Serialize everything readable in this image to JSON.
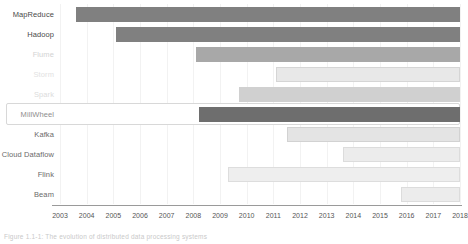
{
  "chart_data": {
    "type": "bar",
    "orientation": "horizontal",
    "subtype": "gantt-timeline",
    "title": "",
    "xlabel": "",
    "ylabel": "",
    "xlim": [
      2003,
      2018
    ],
    "grid": true,
    "legend": null,
    "categories": [
      "MapReduce",
      "Hadoop",
      "Flume",
      "Storm",
      "Spark",
      "MillWheel",
      "Kafka",
      "Cloud Dataflow",
      "Flink",
      "Beam"
    ],
    "xticks": [
      "2003",
      "2004",
      "2005",
      "2006",
      "2007",
      "2008",
      "2009",
      "2010",
      "2011",
      "2012",
      "2013",
      "2014",
      "2015",
      "2016",
      "2017",
      "2018"
    ],
    "bars": [
      {
        "label": "MapReduce",
        "start": 2003.6,
        "end": 2018.0,
        "color": "#808080",
        "label_color": "#4a4a4a",
        "border": "none"
      },
      {
        "label": "Hadoop",
        "start": 2005.1,
        "end": 2018.0,
        "color": "#808080",
        "label_color": "#4a4a4a",
        "border": "none"
      },
      {
        "label": "Flume",
        "start": 2008.1,
        "end": 2018.0,
        "color": "#a8a8a8",
        "label_color": "#d3d3d3",
        "border": "none"
      },
      {
        "label": "Storm",
        "start": 2011.1,
        "end": 2018.0,
        "color": "#e8e8e8",
        "label_color": "#e2e2e2",
        "border": "#d5d5d5"
      },
      {
        "label": "Spark",
        "start": 2009.7,
        "end": 2018.0,
        "color": "#d0d0d0",
        "label_color": "#dcdcdc",
        "border": "none"
      },
      {
        "label": "MillWheel",
        "start": 2008.2,
        "end": 2018.0,
        "color": "#6e6e6e",
        "label_color": "#8e8e8e",
        "border": "none"
      },
      {
        "label": "Kafka",
        "start": 2011.5,
        "end": 2018.0,
        "color": "#e4e4e4",
        "label_color": "#6a6a6a",
        "border": "#d2d2d2"
      },
      {
        "label": "Cloud Dataflow",
        "start": 2013.6,
        "end": 2018.0,
        "color": "#ececec",
        "label_color": "#6a6a6a",
        "border": "#dcdcdc"
      },
      {
        "label": "Flink",
        "start": 2009.3,
        "end": 2018.0,
        "color": "#eeeeee",
        "label_color": "#6a6a6a",
        "border": "#dddddd"
      },
      {
        "label": "Beam",
        "start": 2015.8,
        "end": 2018.0,
        "color": "#ececec",
        "label_color": "#6a6a6a",
        "border": "#dcdcdc"
      }
    ],
    "highlighted_row": "MillWheel"
  },
  "caption": {
    "text": "Figure 1.1-1: The evolution of distributed data processing systems"
  }
}
